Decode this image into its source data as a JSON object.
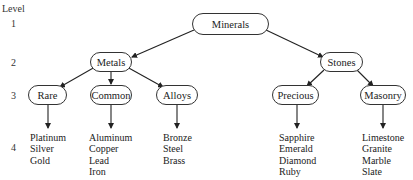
{
  "levels": {
    "header": "Level",
    "items": [
      "1",
      "2",
      "3",
      "4"
    ]
  },
  "tree": {
    "root": "Minerals",
    "level2": [
      "Metals",
      "Stones"
    ],
    "level3": [
      "Rare",
      "Common",
      "Alloys",
      "Precious",
      "Masonry"
    ],
    "leaves": {
      "rare": [
        "Platinum",
        "Silver",
        "Gold"
      ],
      "common": [
        "Aluminum",
        "Copper",
        "Lead",
        "Iron"
      ],
      "alloys": [
        "Bronze",
        "Steel",
        "Brass"
      ],
      "precious": [
        "Sapphire",
        "Emerald",
        "Diamond",
        "Ruby"
      ],
      "masonry": [
        "Limestone",
        "Granite",
        "Marble",
        "Slate"
      ]
    }
  }
}
